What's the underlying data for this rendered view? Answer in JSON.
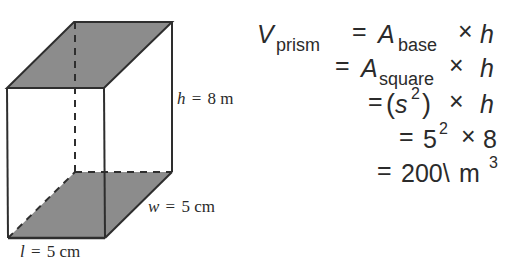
{
  "colors": {
    "face_fill": "#8c8c8c",
    "edge_stroke": "#2e2e2e",
    "text": "#2b2b2b",
    "background": "#ffffff"
  },
  "prism": {
    "shape": "rectangular-prism",
    "shaded_faces": [
      "top",
      "bottom"
    ],
    "hidden_edges": "dashed",
    "labels": {
      "height": {
        "var": "h",
        "eq": "=",
        "value": "8 m"
      },
      "width": {
        "var": "w",
        "eq": "=",
        "value": "5 cm"
      },
      "length": {
        "var": "l",
        "eq": "=",
        "value": "5 cm"
      }
    }
  },
  "equation": {
    "lines": [
      {
        "lhs": "V",
        "lhs_sub": "prism",
        "eq": "=",
        "term": "A",
        "term_sub": "base",
        "times": "×",
        "rhs": "h"
      },
      {
        "eq": "=",
        "term": "A",
        "term_sub": "square",
        "times": "×",
        "rhs": "h"
      },
      {
        "eq": "=",
        "open": "(",
        "base": "s",
        "sup": "2",
        "close": ")",
        "times": "×",
        "rhs": "h"
      },
      {
        "eq": "=",
        "base": "5",
        "sup": "2",
        "times": "×",
        "rhs": "8"
      },
      {
        "eq": "=",
        "value": "200\\",
        "unit": "m",
        "sup": "3"
      }
    ]
  }
}
